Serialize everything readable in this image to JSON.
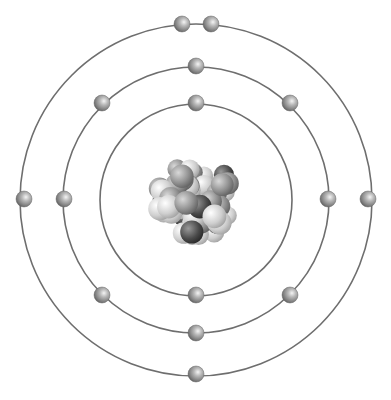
{
  "diagram": {
    "center": [
      196,
      200
    ],
    "colors": {
      "background": "#ffffff",
      "orbit": "#6e6e6e",
      "electron_light": "#e8e8e8",
      "electron_mid": "#a0a0a0",
      "electron_dark": "#555555"
    },
    "orbits": [
      {
        "name": "shell-1",
        "radius": 96,
        "electron_count": 2
      },
      {
        "name": "shell-2",
        "radius": 133,
        "electron_count": 8
      },
      {
        "name": "shell-3",
        "radius": 176,
        "electron_count": 5
      }
    ],
    "electrons": [
      {
        "shell": 1,
        "x": 196,
        "y": 103
      },
      {
        "shell": 1,
        "x": 196,
        "y": 295
      },
      {
        "shell": 2,
        "x": 196,
        "y": 66
      },
      {
        "shell": 2,
        "x": 102,
        "y": 103
      },
      {
        "shell": 2,
        "x": 290,
        "y": 103
      },
      {
        "shell": 2,
        "x": 64,
        "y": 199
      },
      {
        "shell": 2,
        "x": 328,
        "y": 199
      },
      {
        "shell": 2,
        "x": 102,
        "y": 295
      },
      {
        "shell": 2,
        "x": 290,
        "y": 295
      },
      {
        "shell": 2,
        "x": 196,
        "y": 333
      },
      {
        "shell": 3,
        "x": 182,
        "y": 24
      },
      {
        "shell": 3,
        "x": 211,
        "y": 24
      },
      {
        "shell": 3,
        "x": 24,
        "y": 199
      },
      {
        "shell": 3,
        "x": 368,
        "y": 199
      },
      {
        "shell": 3,
        "x": 196,
        "y": 374
      }
    ],
    "electron_radius": 8,
    "nucleus": {
      "cx": 196,
      "cy": 199,
      "radius": 48,
      "label": "nucleus"
    }
  }
}
